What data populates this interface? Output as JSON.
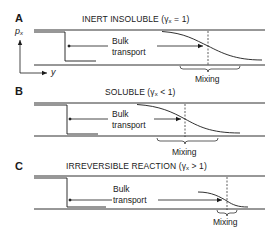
{
  "panels": [
    {
      "letter": "A",
      "title_main": "INERT INSOLUBLE (",
      "title_sym": "γ",
      "title_sub": "x",
      "title_rel": " = 1)",
      "bulk_line1": "Bulk",
      "bulk_line2": "transport",
      "mixing": "Mixing"
    },
    {
      "letter": "B",
      "title_main": "SOLUBLE (",
      "title_sym": "γ",
      "title_sub": "x",
      "title_rel": " < 1)",
      "bulk_line1": "Bulk",
      "bulk_line2": "transport",
      "mixing": "Mixing"
    },
    {
      "letter": "C",
      "title_main": "IRREVERSIBLE REACTION (",
      "title_sym": "γ",
      "title_sub": "x",
      "title_rel": " > 1)",
      "bulk_line1": "Bulk",
      "bulk_line2": "transport",
      "mixing": "Mixing"
    }
  ],
  "axes": {
    "y_label": "p",
    "y_label_sub": "x",
    "x_label": "y"
  },
  "colors": {
    "ink": "#1a1a1a",
    "background": "#ffffff"
  }
}
